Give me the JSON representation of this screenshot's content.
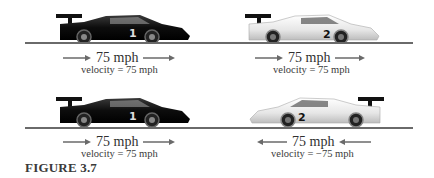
{
  "figure": {
    "caption": "FIGURE 3.7",
    "panels": [
      {
        "car1": {
          "number": "1",
          "color": "black",
          "direction": "right",
          "speed": "75 mph",
          "velocity": "velocity = 75 mph"
        },
        "car2": {
          "number": "2",
          "color": "white",
          "direction": "right",
          "speed": "75 mph",
          "velocity": "velocity = 75 mph"
        }
      },
      {
        "car1": {
          "number": "1",
          "color": "black",
          "direction": "right",
          "speed": "75 mph",
          "velocity": "velocity = 75 mph"
        },
        "car2": {
          "number": "2",
          "color": "white",
          "direction": "left",
          "speed": "75 mph",
          "velocity": "velocity = −75 mph"
        }
      }
    ]
  },
  "colors": {
    "ground": "#6a6a6a",
    "arrow": "#6a6a6a",
    "car_dark": "#111111",
    "car_light": "#eeeeee"
  }
}
